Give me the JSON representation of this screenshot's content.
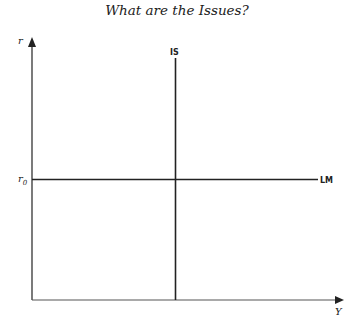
{
  "title": "What are the Issues?",
  "diagram": {
    "y_axis_label": "r",
    "x_axis_label": "Y",
    "is_label": "IS",
    "lm_label": "LM",
    "r0_label": "r0",
    "r0_main": "r",
    "r0_sub": "0"
  }
}
